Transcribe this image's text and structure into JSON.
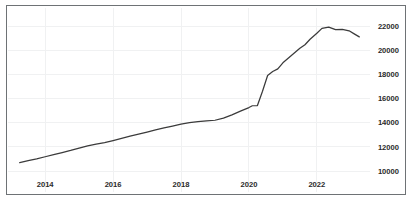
{
  "chart_data": {
    "type": "line",
    "title": "",
    "subtitle": "",
    "xlabel": "",
    "ylabel": "",
    "grid": true,
    "legend": "none",
    "xlim": [
      2013.2,
      2023.3
    ],
    "ylim": [
      9450,
      22550
    ],
    "x_ticks": [
      2014,
      2016,
      2018,
      2020,
      2022
    ],
    "x_tick_labels": [
      "2014",
      "2016",
      "2018",
      "2020",
      "2022"
    ],
    "y_ticks": [
      10000,
      12000,
      14000,
      16000,
      18000,
      20000,
      22000
    ],
    "y_tick_labels": [
      "10000",
      "12000",
      "14000",
      "16000",
      "18000",
      "20000",
      "22000"
    ],
    "y_axis_side": "right",
    "series": [
      {
        "name": "series-1",
        "color": "#3b3b3b",
        "x": [
          2013.25,
          2013.5,
          2013.75,
          2014.0,
          2014.25,
          2014.5,
          2014.75,
          2015.0,
          2015.25,
          2015.5,
          2015.75,
          2016.0,
          2016.25,
          2016.5,
          2016.75,
          2017.0,
          2017.25,
          2017.5,
          2017.75,
          2018.0,
          2018.25,
          2018.5,
          2018.75,
          2019.0,
          2019.25,
          2019.5,
          2019.75,
          2020.0,
          2020.1,
          2020.25,
          2020.4,
          2020.55,
          2020.7,
          2020.85,
          2021.0,
          2021.25,
          2021.5,
          2021.65,
          2021.8,
          2022.0,
          2022.15,
          2022.35,
          2022.55,
          2022.75,
          2022.95,
          2023.1,
          2023.25
        ],
        "y": [
          10700,
          10850,
          11000,
          11180,
          11350,
          11520,
          11700,
          11900,
          12080,
          12220,
          12350,
          12520,
          12700,
          12880,
          13050,
          13220,
          13400,
          13560,
          13720,
          13880,
          14000,
          14080,
          14150,
          14200,
          14380,
          14650,
          14950,
          15250,
          15400,
          15420,
          16600,
          17900,
          18230,
          18450,
          18950,
          19550,
          20150,
          20450,
          20900,
          21400,
          21800,
          21900,
          21700,
          21720,
          21600,
          21350,
          21100
        ]
      }
    ],
    "annotations": [
      {
        "label": "sharp-rise",
        "x": 2020.3,
        "note": "step increase from ~15400 to ~18200"
      },
      {
        "label": "peak",
        "x": 2022.35,
        "value": 21900
      },
      {
        "label": "end",
        "x": 2023.25,
        "value": 21100
      }
    ]
  },
  "frame": {
    "border_color": "#6e7275",
    "grid_color": "#f0f1f2",
    "background": "#ffffff",
    "line_color": "#3b3b3b"
  }
}
